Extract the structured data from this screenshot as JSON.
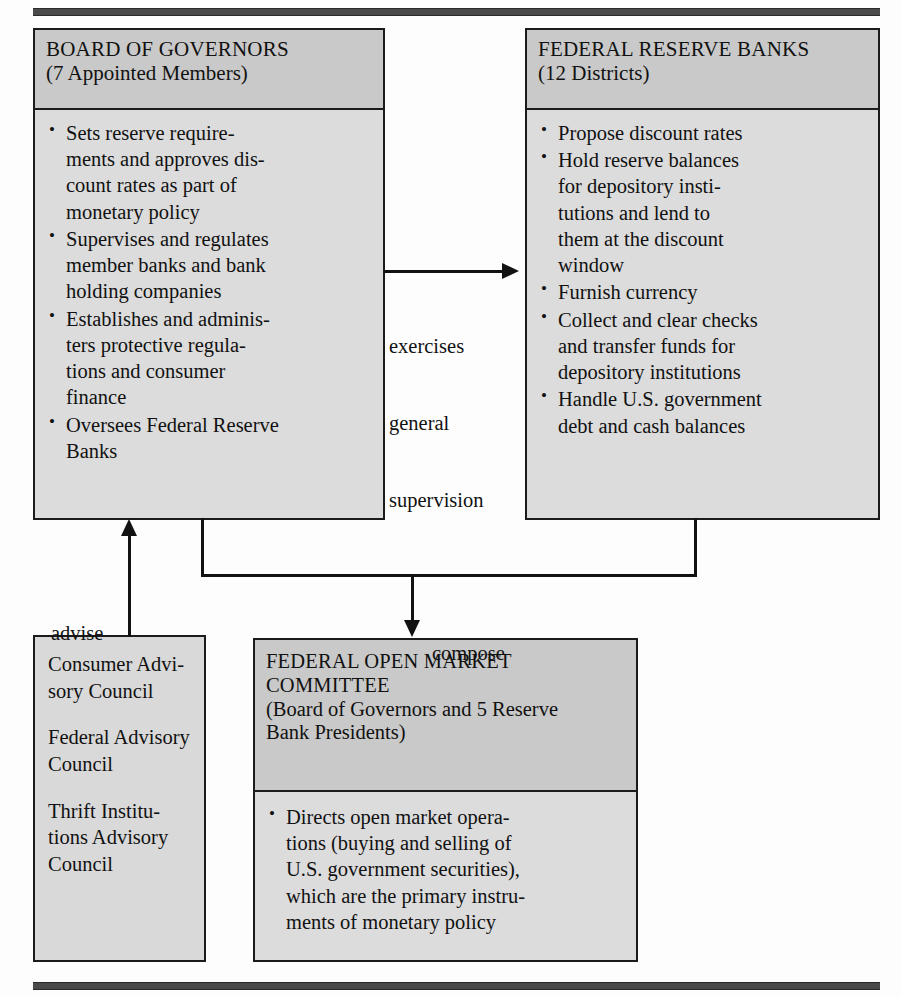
{
  "diagram": {
    "title_rules": {
      "top": "rule",
      "bottom": "rule"
    },
    "boxes": {
      "board_of_governors": {
        "header": {
          "line1": "BOARD OF GOVERNORS",
          "line2": "(7 Appointed Members)"
        },
        "bullets": [
          [
            "Sets reserve require-",
            "ments and approves dis-",
            "count rates as part of",
            "monetary policy"
          ],
          [
            "Supervises and regulates",
            "member banks and bank",
            "holding companies"
          ],
          [
            "Establishes and adminis-",
            "ters protective regula-",
            "tions and consumer",
            "finance"
          ],
          [
            "Oversees Federal Reserve",
            "Banks"
          ]
        ]
      },
      "federal_reserve_banks": {
        "header": {
          "line1": "FEDERAL RESERVE BANKS",
          "line2": "(12 Districts)"
        },
        "bullets": [
          [
            "Propose discount rates"
          ],
          [
            "Hold reserve balances",
            "for depository insti-",
            "tutions and lend to",
            "them at the discount",
            "window"
          ],
          [
            "Furnish currency"
          ],
          [
            "Collect and clear checks",
            "and transfer funds for",
            "depository institutions"
          ],
          [
            "Handle U.S. government",
            "debt and cash balances"
          ]
        ]
      },
      "advisory_councils": {
        "groups": [
          [
            "Consumer Advi-",
            "sory Council"
          ],
          [
            "Federal Advisory",
            "Council"
          ],
          [
            "Thrift Institu-",
            "tions Advisory",
            "Council"
          ]
        ]
      },
      "federal_open_market_committee": {
        "header": {
          "line1": "FEDERAL OPEN MARKET",
          "line2": "COMMITTEE",
          "line3": "(Board of Governors and 5 Reserve",
          "line4": "Bank Presidents)"
        },
        "bullets": [
          [
            "Directs open market opera-",
            "tions (buying and selling of",
            "U.S. government securities),",
            "which are the primary instru-",
            "ments of monetary policy"
          ]
        ]
      }
    },
    "edges": {
      "supervision": {
        "line1": "exercises",
        "line2": "general",
        "line3": "supervision"
      },
      "advise": {
        "label": "advise"
      },
      "compose": {
        "label": "compose"
      }
    },
    "colors": {
      "box_fill": "#dcdcdc",
      "header_fill": "#c9c9c9",
      "border": "#1b1b1b",
      "line": "#121212",
      "page_background": "#fdfdfd"
    }
  }
}
